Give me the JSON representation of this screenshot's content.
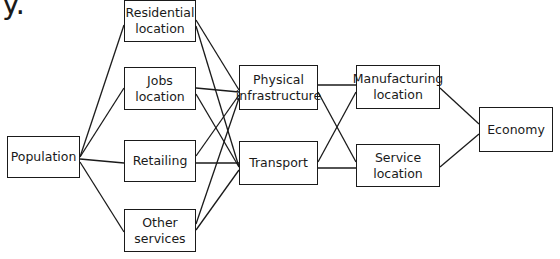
{
  "heading_fragment": "y.",
  "nodes": {
    "population": "Population",
    "residential": "Residential\nlocation",
    "jobs": "Jobs\nlocation",
    "retailing": "Retailing",
    "other": "Other\nservices",
    "physical": "Physical\ninfrastructure",
    "transport": "Transport",
    "manufacturing": "Manufacturing\nlocation",
    "service": "Service\nlocation",
    "economy": "Economy"
  },
  "edges": [
    [
      "population",
      "residential"
    ],
    [
      "population",
      "jobs"
    ],
    [
      "population",
      "retailing"
    ],
    [
      "population",
      "other"
    ],
    [
      "residential",
      "physical"
    ],
    [
      "residential",
      "transport"
    ],
    [
      "jobs",
      "physical"
    ],
    [
      "jobs",
      "transport"
    ],
    [
      "retailing",
      "physical"
    ],
    [
      "retailing",
      "transport"
    ],
    [
      "other",
      "physical"
    ],
    [
      "other",
      "transport"
    ],
    [
      "physical",
      "manufacturing"
    ],
    [
      "physical",
      "service"
    ],
    [
      "transport",
      "manufacturing"
    ],
    [
      "transport",
      "service"
    ],
    [
      "manufacturing",
      "economy"
    ],
    [
      "service",
      "economy"
    ]
  ]
}
